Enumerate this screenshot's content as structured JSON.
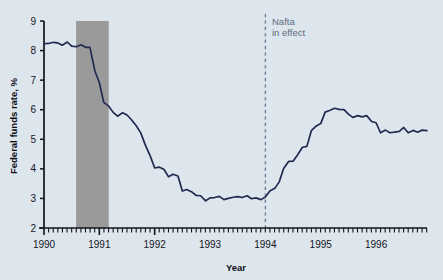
{
  "chart_data": {
    "type": "line",
    "title": "",
    "subtitle": "",
    "xlabel": "Year",
    "ylabel": "Federal funds rate, %",
    "xlim": [
      1990.0,
      1996.92
    ],
    "ylim": [
      2,
      9
    ],
    "ytick_labels": [
      "9",
      "8",
      "7",
      "6",
      "5",
      "4",
      "3",
      "2"
    ],
    "ytick_values": [
      9,
      8,
      7,
      6,
      5,
      4,
      3,
      2
    ],
    "xtick_labels": [
      "1990",
      "1991",
      "1992",
      "1993",
      "1994",
      "1995",
      "1996"
    ],
    "xtick_values": [
      1990,
      1991,
      1992,
      1993,
      1994,
      1995,
      1996
    ],
    "minor_tick_interval": 0.0833,
    "grid": false,
    "legend": null,
    "line_color": "#232a50",
    "series": [
      {
        "name": "Federal funds rate",
        "x": [
          1990.0,
          1990.08,
          1990.17,
          1990.25,
          1990.33,
          1990.42,
          1990.5,
          1990.58,
          1990.67,
          1990.75,
          1990.83,
          1990.92,
          1991.0,
          1991.08,
          1991.17,
          1991.25,
          1991.33,
          1991.42,
          1991.5,
          1991.58,
          1991.67,
          1991.75,
          1991.83,
          1991.92,
          1992.0,
          1992.08,
          1992.17,
          1992.25,
          1992.33,
          1992.42,
          1992.5,
          1992.58,
          1992.67,
          1992.75,
          1992.83,
          1992.92,
          1993.0,
          1993.08,
          1993.17,
          1993.25,
          1993.33,
          1993.42,
          1993.5,
          1993.58,
          1993.67,
          1993.75,
          1993.83,
          1993.92,
          1994.0,
          1994.08,
          1994.17,
          1994.25,
          1994.33,
          1994.42,
          1994.5,
          1994.58,
          1994.67,
          1994.75,
          1994.83,
          1994.92,
          1995.0,
          1995.08,
          1995.17,
          1995.25,
          1995.33,
          1995.42,
          1995.5,
          1995.58,
          1995.67,
          1995.75,
          1995.83,
          1995.92,
          1996.0,
          1996.08,
          1996.17,
          1996.25,
          1996.33,
          1996.42,
          1996.5,
          1996.58,
          1996.67,
          1996.75,
          1996.83,
          1996.92
        ],
        "y": [
          8.23,
          8.24,
          8.28,
          8.26,
          8.18,
          8.29,
          8.15,
          8.13,
          8.2,
          8.11,
          8.11,
          7.31,
          6.91,
          6.25,
          6.12,
          5.91,
          5.78,
          5.9,
          5.82,
          5.66,
          5.45,
          5.21,
          4.81,
          4.43,
          4.03,
          4.06,
          3.98,
          3.73,
          3.82,
          3.76,
          3.25,
          3.3,
          3.22,
          3.1,
          3.09,
          2.92,
          3.02,
          3.03,
          3.07,
          2.96,
          3.0,
          3.04,
          3.06,
          3.03,
          3.09,
          2.99,
          3.02,
          2.96,
          3.05,
          3.25,
          3.34,
          3.56,
          4.01,
          4.25,
          4.26,
          4.47,
          4.73,
          4.76,
          5.29,
          5.45,
          5.53,
          5.92,
          5.98,
          6.05,
          6.01,
          6.0,
          5.85,
          5.74,
          5.8,
          5.76,
          5.8,
          5.6,
          5.56,
          5.22,
          5.31,
          5.22,
          5.24,
          5.27,
          5.4,
          5.22,
          5.3,
          5.24,
          5.31,
          5.29
        ]
      }
    ],
    "shaded_regions": [
      {
        "name": "recession",
        "x_start": 1990.58,
        "x_end": 1991.17,
        "color": "#9a9a9a"
      }
    ],
    "annotations": [
      {
        "name": "nafta-marker",
        "x": 1994.0,
        "line_style": "dashed",
        "color": "#6d7d93",
        "label_lines": [
          "Nafta",
          "in effect"
        ]
      }
    ]
  },
  "colors": {
    "background": "#dde6ed",
    "axis": "#14141c",
    "line": "#232a50",
    "shade": "#9a9a9a",
    "marker": "#6d7d93",
    "annotation_text": "#5a6a80"
  }
}
